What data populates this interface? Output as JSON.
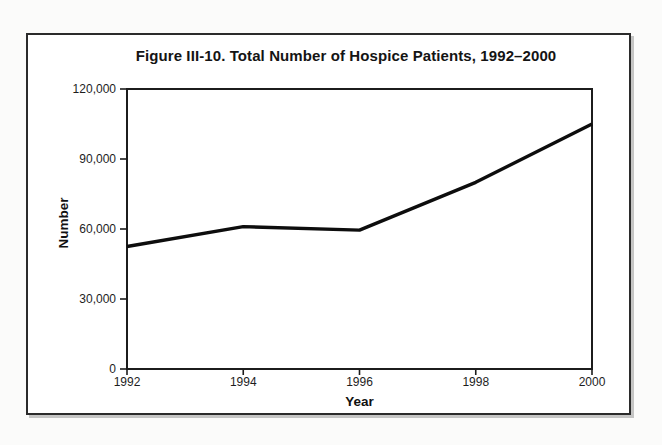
{
  "figure": {
    "title": "Figure III-10. Total Number of Hospice Patients, 1992–2000"
  },
  "chart_data": {
    "type": "line",
    "title": "Figure III-10. Total Number of Hospice Patients, 1992–2000",
    "xlabel": "Year",
    "ylabel": "Number",
    "x": [
      1992,
      1994,
      1996,
      1998,
      2000
    ],
    "x_tick_labels": [
      "1992",
      "1994",
      "1996",
      "1998",
      "2000"
    ],
    "values": [
      52500,
      61000,
      59500,
      80000,
      105000
    ],
    "xlim": [
      1992,
      2000
    ],
    "ylim": [
      0,
      120000
    ],
    "y_ticks": [
      0,
      30000,
      60000,
      90000,
      120000
    ],
    "y_tick_labels": [
      "0",
      "30,000",
      "60,000",
      "90,000",
      "120,000"
    ],
    "grid": false,
    "legend": "none",
    "line_color": "#0d0d0d",
    "axis_color": "#1c1c1c"
  }
}
